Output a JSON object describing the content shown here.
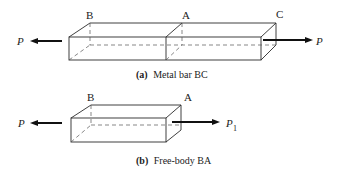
{
  "figure_a": {
    "points": {
      "left": "B",
      "middle": "A",
      "right": "C"
    },
    "forces": {
      "left": "P",
      "right": "P"
    },
    "caption_tag": "(a)",
    "caption_text": "Metal bar BC"
  },
  "figure_b": {
    "points": {
      "left": "B",
      "right": "A"
    },
    "forces": {
      "left": "P",
      "right": "P",
      "right_subscript": "1"
    },
    "caption_tag": "(b)",
    "caption_text": "Free-body BA"
  }
}
